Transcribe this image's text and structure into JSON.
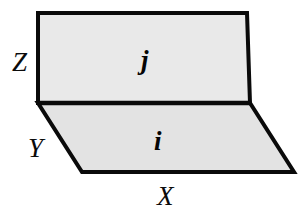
{
  "figure": {
    "type": "3d-plane-diagram",
    "background_color": "#ffffff",
    "stroke_color": "#0a0a0a",
    "stroke_width": 4,
    "planes": [
      {
        "id": "plane-j",
        "label": "j",
        "orientation": "vertical",
        "fill_color": "#e9e9e9",
        "points": "38,13 247,13 250,103 38,103"
      },
      {
        "id": "plane-i",
        "label": "i",
        "orientation": "horizontal",
        "fill_color": "#e3e3e3",
        "points": "38,103 250,103 294,172 82,172"
      }
    ],
    "shared_edge": {
      "from_x": 38,
      "from_y": 103,
      "to_x": 250,
      "to_y": 103
    },
    "axis_labels": [
      {
        "id": "label-Z",
        "text": "Z",
        "x": 22,
        "y": 64
      },
      {
        "id": "label-Y",
        "text": "Y",
        "x": 38,
        "y": 150
      },
      {
        "id": "label-X",
        "text": "X",
        "x": 167,
        "y": 198
      }
    ],
    "plane_labels": [
      {
        "id": "label-j",
        "text": "j",
        "x": 148,
        "y": 62
      },
      {
        "id": "label-i",
        "text": "i",
        "x": 160,
        "y": 143
      }
    ]
  }
}
